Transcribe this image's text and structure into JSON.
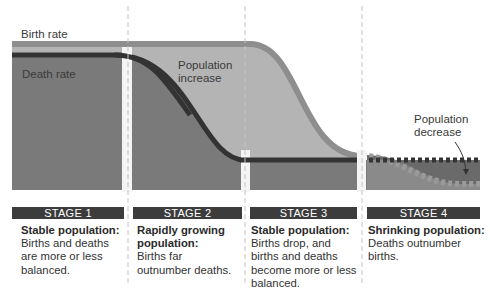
{
  "labels": {
    "birth_rate": "Birth rate",
    "death_rate": "Death rate",
    "population_increase": [
      "Population",
      "increase"
    ],
    "population_decrease": [
      "Population",
      "decrease"
    ]
  },
  "stages": [
    {
      "label": "STAGE 1",
      "title": "Stable population:",
      "description": [
        "Births and deaths",
        "are more or less",
        "balanced."
      ]
    },
    {
      "label": "STAGE 2",
      "title": "Rapidly growing population:",
      "title_lines": [
        "Rapidly growing",
        "population:"
      ],
      "description": [
        "Births far",
        "outnumber deaths."
      ]
    },
    {
      "label": "STAGE 3",
      "title": "Stable population:",
      "description": [
        "Births drop, and",
        "births and deaths",
        "become more or less",
        "balanced."
      ]
    },
    {
      "label": "STAGE 4",
      "title": "Shrinking population:",
      "description": [
        "Deaths outnumber",
        "births."
      ]
    }
  ],
  "colors": {
    "death_area": "#7a7a7a",
    "increase_area": "#b4b4b4",
    "birth_line": "#8e8e8e",
    "death_line": "#333333",
    "stage_bar": "#3c3c3c",
    "divider": "#bdbdbd"
  }
}
